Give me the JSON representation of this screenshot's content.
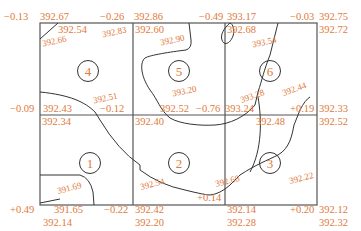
{
  "diagram": {
    "type": "square-grid earthwork (fill/cut) diagram",
    "label_color": "#e07a3a",
    "line_color": "#555555",
    "cells": [
      {
        "id": "1",
        "label": "1"
      },
      {
        "id": "2",
        "label": "2"
      },
      {
        "id": "3",
        "label": "3"
      },
      {
        "id": "4",
        "label": "4"
      },
      {
        "id": "5",
        "label": "5"
      },
      {
        "id": "6",
        "label": "6"
      }
    ],
    "corner_labels": {
      "top_row": [
        {
          "cut_fill": "−0.13",
          "design": "392.67",
          "ground": "392.54"
        },
        {
          "cut_fill": "−0.26",
          "design": "392.86",
          "ground": "392.60"
        },
        {
          "cut_fill": "−0.49",
          "design": "393.17",
          "ground": "392.68"
        },
        {
          "cut_fill": "−0.03",
          "design": "392.75",
          "ground": "392.72"
        }
      ],
      "middle_row": [
        {
          "cut_fill": "−0.09",
          "design": "392.43",
          "ground": "392.34"
        },
        {
          "cut_fill": "−0.12",
          "design": "392.52",
          "ground": "392.40"
        },
        {
          "cut_fill": "−0.76",
          "design": "393.24",
          "ground": "392.48"
        },
        {
          "cut_fill": "+0.19",
          "design": "392.33",
          "ground": "392.52"
        }
      ],
      "bottom_row": [
        {
          "cut_fill": "+0.49",
          "design": "391.65",
          "ground": "392.14"
        },
        {
          "cut_fill": "−0.22",
          "design": "392.42",
          "ground": "392.20"
        },
        {
          "cut_fill": "+0.14",
          "design": "392.14",
          "ground": "392.28"
        },
        {
          "cut_fill": "+0.20",
          "design": "392.12",
          "ground": "392.32"
        }
      ]
    },
    "contour_labels": [
      "392.66",
      "392.83",
      "392.90",
      "393.54",
      "392.51",
      "393.20",
      "393.28",
      "392.44",
      "391.69",
      "392.54",
      "392.68",
      "392.22"
    ]
  }
}
